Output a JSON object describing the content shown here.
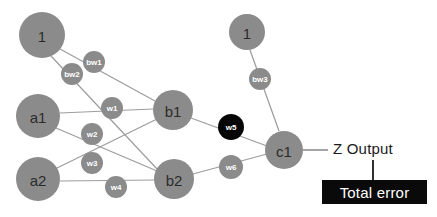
{
  "diagram": {
    "colors": {
      "node_gray": "#8b8b8b",
      "highlight_black": "#060606",
      "edge_gray": "#9d9d9d",
      "background": "#ffffff",
      "text_dark": "#2b2b2b",
      "box_bg": "#0a0a0a",
      "box_text": "#ffffff"
    },
    "nodes": [
      {
        "id": "bias1",
        "label": "1",
        "cx": 42,
        "cy": 35,
        "r": 23
      },
      {
        "id": "a1",
        "label": "a1",
        "cx": 38,
        "cy": 116,
        "r": 22
      },
      {
        "id": "a2",
        "label": "a2",
        "cx": 38,
        "cy": 179,
        "r": 22
      },
      {
        "id": "b1",
        "label": "b1",
        "cx": 173,
        "cy": 110,
        "r": 20
      },
      {
        "id": "b2",
        "label": "b2",
        "cx": 174,
        "cy": 179,
        "r": 20
      },
      {
        "id": "bias2",
        "label": "1",
        "cx": 247,
        "cy": 32,
        "r": 18
      },
      {
        "id": "c1",
        "label": "c1",
        "cx": 284,
        "cy": 150,
        "r": 19
      }
    ],
    "weights": [
      {
        "id": "bw1",
        "label": "bw1",
        "cx": 94,
        "cy": 62,
        "r": 11,
        "highlight": false
      },
      {
        "id": "bw2",
        "label": "bw2",
        "cx": 72,
        "cy": 74,
        "r": 11,
        "highlight": false
      },
      {
        "id": "bw3",
        "label": "bw3",
        "cx": 260,
        "cy": 79,
        "r": 11,
        "highlight": false
      },
      {
        "id": "w1",
        "label": "w1",
        "cx": 112,
        "cy": 108,
        "r": 11,
        "highlight": false
      },
      {
        "id": "w2",
        "label": "w2",
        "cx": 92,
        "cy": 134,
        "r": 11,
        "highlight": false
      },
      {
        "id": "w3",
        "label": "w3",
        "cx": 92,
        "cy": 163,
        "r": 11,
        "highlight": false
      },
      {
        "id": "w4",
        "label": "w4",
        "cx": 116,
        "cy": 187,
        "r": 11,
        "highlight": false
      },
      {
        "id": "w5",
        "label": "w5",
        "cx": 231,
        "cy": 127,
        "r": 13,
        "highlight": true
      },
      {
        "id": "w6",
        "label": "w6",
        "cx": 231,
        "cy": 167,
        "r": 12,
        "highlight": false
      }
    ],
    "edges": [
      {
        "id": "bias1-b1",
        "from": "bias1",
        "to": "b1",
        "weight": "bw1",
        "x1": 60,
        "y1": 49,
        "x2": 155,
        "y2": 101
      },
      {
        "id": "bias1-b2",
        "from": "bias1",
        "to": "b2",
        "weight": "bw2",
        "x1": 51,
        "y1": 56,
        "x2": 158,
        "y2": 170
      },
      {
        "id": "a1-b1",
        "from": "a1",
        "to": "b1",
        "weight": "w1",
        "x1": 60,
        "y1": 113,
        "x2": 153,
        "y2": 109
      },
      {
        "id": "a1-b2",
        "from": "a1",
        "to": "b2",
        "weight": "w2",
        "x1": 56,
        "y1": 128,
        "x2": 157,
        "y2": 171
      },
      {
        "id": "a2-b1",
        "from": "a2",
        "to": "b1",
        "weight": "w3",
        "x1": 55,
        "y1": 169,
        "x2": 157,
        "y2": 119
      },
      {
        "id": "a2-b2",
        "from": "a2",
        "to": "b2",
        "weight": "w4",
        "x1": 60,
        "y1": 181,
        "x2": 155,
        "y2": 180
      },
      {
        "id": "b1-c1",
        "from": "b1",
        "to": "c1",
        "weight": "w5",
        "x1": 191,
        "y1": 118,
        "x2": 267,
        "y2": 146
      },
      {
        "id": "b2-c1",
        "from": "b2",
        "to": "c1",
        "weight": "w6",
        "x1": 193,
        "y1": 174,
        "x2": 267,
        "y2": 154
      },
      {
        "id": "bias2-c1",
        "from": "bias2",
        "to": "c1",
        "weight": "bw3",
        "x1": 250,
        "y1": 50,
        "x2": 279,
        "y2": 131
      }
    ],
    "output": {
      "line": {
        "x1": 303,
        "y1": 150,
        "x2": 328,
        "y2": 150
      },
      "label": "Z Output",
      "label_x": 333,
      "label_y": 140
    },
    "error": {
      "label": "Total error",
      "box_x": 322,
      "box_y": 180,
      "box_w": 105,
      "box_h": 24,
      "connector": {
        "x1": 373,
        "y1": 160,
        "x2": 373,
        "y2": 180
      }
    }
  },
  "chart_data": {
    "type": "diagram",
    "layers": [
      {
        "name": "input",
        "nodes": [
          "a1",
          "a2"
        ]
      },
      {
        "name": "hidden",
        "nodes": [
          "b1",
          "b2"
        ]
      },
      {
        "name": "output",
        "nodes": [
          "c1"
        ]
      },
      {
        "name": "bias",
        "nodes": [
          "1",
          "1"
        ]
      }
    ],
    "connections": [
      {
        "from": "1",
        "to": "b1",
        "weight": "bw1"
      },
      {
        "from": "1",
        "to": "b2",
        "weight": "bw2"
      },
      {
        "from": "a1",
        "to": "b1",
        "weight": "w1"
      },
      {
        "from": "a1",
        "to": "b2",
        "weight": "w2"
      },
      {
        "from": "a2",
        "to": "b1",
        "weight": "w3"
      },
      {
        "from": "a2",
        "to": "b2",
        "weight": "w4"
      },
      {
        "from": "b1",
        "to": "c1",
        "weight": "w5"
      },
      {
        "from": "b2",
        "to": "c1",
        "weight": "w6"
      },
      {
        "from": "1",
        "to": "c1",
        "weight": "bw3"
      },
      {
        "from": "c1",
        "to": "Z Output",
        "weight": null
      }
    ],
    "highlighted_weight": "w5",
    "annotations": [
      "Z Output",
      "Total error"
    ]
  }
}
